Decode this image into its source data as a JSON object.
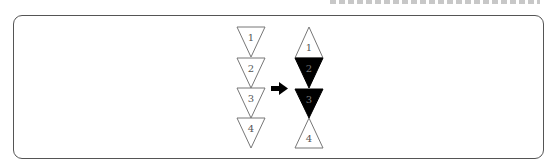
{
  "diagram": {
    "colors": {
      "frame": "#555555",
      "outline": "#777777",
      "filled": "#000000",
      "label_on_white": "#555555",
      "label_on_black": "#777777",
      "arrow": "#000000"
    },
    "before": {
      "triangles": [
        {
          "label": "1",
          "direction": "down",
          "fill": "white"
        },
        {
          "label": "2",
          "direction": "down",
          "fill": "white"
        },
        {
          "label": "3",
          "direction": "down",
          "fill": "white"
        },
        {
          "label": "4",
          "direction": "down",
          "fill": "white"
        }
      ]
    },
    "arrow": {
      "direction": "right"
    },
    "after": {
      "triangles": [
        {
          "label": "1",
          "direction": "up",
          "fill": "white"
        },
        {
          "label": "2",
          "direction": "down",
          "fill": "black"
        },
        {
          "label": "3",
          "direction": "down",
          "fill": "black"
        },
        {
          "label": "4",
          "direction": "up",
          "fill": "white"
        }
      ]
    }
  }
}
